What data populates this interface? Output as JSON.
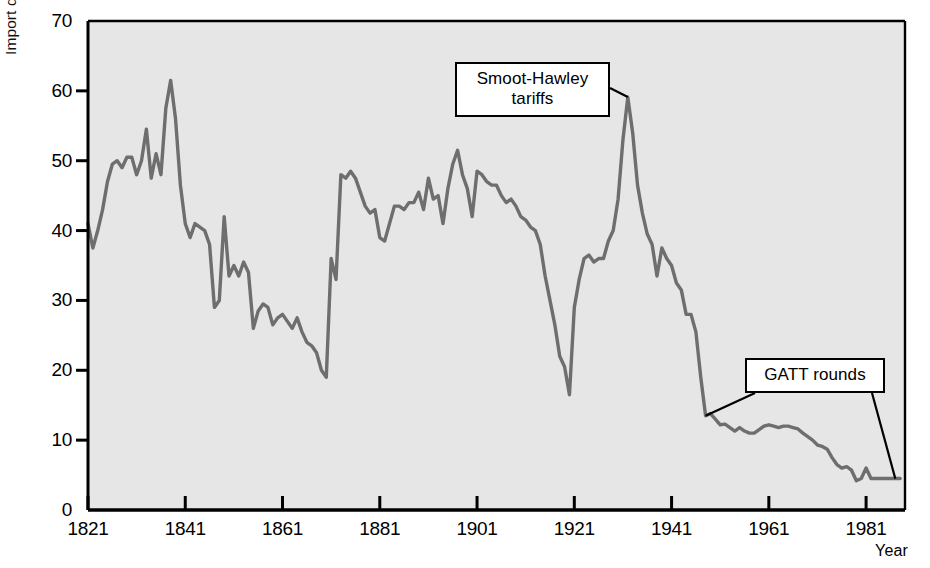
{
  "chart_data": {
    "type": "line",
    "title": "",
    "xlabel": "Year",
    "ylabel": "Import duties (percentage of imports)",
    "xlim": [
      1821,
      1989
    ],
    "ylim": [
      0,
      70
    ],
    "xticks": [
      1821,
      1841,
      1861,
      1881,
      1901,
      1921,
      1941,
      1961,
      1981
    ],
    "yticks": [
      0,
      10,
      20,
      30,
      40,
      50,
      60,
      70
    ],
    "grid": false,
    "legend": null,
    "series_name": "U.S. import duties as percentage of imports",
    "line_color": "#6e6e6e",
    "plot_background": "#e6e6e6",
    "axis_color": "#000000",
    "annotations": [
      {
        "label": "Smoot-Hawley tariffs",
        "lines": [
          "Smoot-Hawley",
          "tariffs"
        ],
        "points_to_year": 1932,
        "points_to_value": 59.1
      },
      {
        "label": "GATT rounds",
        "lines": [
          "GATT rounds"
        ],
        "points_to_year": 1948,
        "points_to_value": 13.5,
        "points_to_year_2": 1987,
        "points_to_value_2": 4.5
      }
    ],
    "x": [
      1821,
      1822,
      1823,
      1824,
      1825,
      1826,
      1827,
      1828,
      1829,
      1830,
      1831,
      1832,
      1833,
      1834,
      1835,
      1836,
      1837,
      1838,
      1839,
      1840,
      1841,
      1842,
      1843,
      1844,
      1845,
      1846,
      1847,
      1848,
      1849,
      1850,
      1851,
      1852,
      1853,
      1854,
      1855,
      1856,
      1857,
      1858,
      1859,
      1860,
      1861,
      1862,
      1863,
      1864,
      1865,
      1866,
      1867,
      1868,
      1869,
      1870,
      1871,
      1872,
      1873,
      1874,
      1875,
      1876,
      1877,
      1878,
      1879,
      1880,
      1881,
      1882,
      1883,
      1884,
      1885,
      1886,
      1887,
      1888,
      1889,
      1890,
      1891,
      1892,
      1893,
      1894,
      1895,
      1896,
      1897,
      1898,
      1899,
      1900,
      1901,
      1902,
      1903,
      1904,
      1905,
      1906,
      1907,
      1908,
      1909,
      1910,
      1911,
      1912,
      1913,
      1914,
      1915,
      1916,
      1917,
      1918,
      1919,
      1920,
      1921,
      1922,
      1923,
      1924,
      1925,
      1926,
      1927,
      1928,
      1929,
      1930,
      1931,
      1932,
      1933,
      1934,
      1935,
      1936,
      1937,
      1938,
      1939,
      1940,
      1941,
      1942,
      1943,
      1944,
      1945,
      1946,
      1947,
      1948,
      1949,
      1950,
      1951,
      1952,
      1953,
      1954,
      1955,
      1956,
      1957,
      1958,
      1959,
      1960,
      1961,
      1962,
      1963,
      1964,
      1965,
      1966,
      1967,
      1968,
      1969,
      1970,
      1971,
      1972,
      1973,
      1974,
      1975,
      1976,
      1977,
      1978,
      1979,
      1980,
      1981,
      1982,
      1983,
      1984,
      1985,
      1986,
      1987,
      1988
    ],
    "y": [
      41.0,
      37.5,
      40.0,
      43.0,
      47.0,
      49.5,
      50.0,
      49.0,
      50.5,
      50.5,
      48.0,
      50.0,
      54.5,
      47.5,
      51.0,
      48.0,
      57.5,
      61.5,
      56.0,
      46.5,
      41.0,
      39.0,
      41.0,
      40.5,
      40.0,
      38.0,
      29.0,
      30.0,
      42.0,
      33.5,
      35.0,
      33.5,
      35.5,
      34.0,
      26.0,
      28.5,
      29.5,
      29.0,
      26.5,
      27.5,
      28.0,
      27.0,
      26.0,
      27.5,
      25.5,
      24.0,
      23.5,
      22.5,
      20.0,
      19.0,
      36.0,
      33.0,
      48.0,
      47.5,
      48.5,
      47.5,
      45.5,
      43.5,
      42.5,
      43.0,
      39.0,
      38.5,
      41.0,
      43.5,
      43.5,
      43.0,
      44.0,
      44.0,
      45.5,
      43.0,
      47.5,
      44.5,
      45.0,
      41.0,
      46.0,
      49.5,
      51.5,
      48.0,
      46.0,
      42.0,
      48.5,
      48.0,
      47.0,
      46.5,
      46.5,
      45.0,
      44.0,
      44.5,
      43.5,
      42.0,
      41.5,
      40.5,
      40.0,
      38.0,
      33.5,
      30.0,
      26.5,
      22.0,
      20.5,
      16.5,
      29.0,
      33.0,
      36.0,
      36.5,
      35.5,
      36.0,
      36.0,
      38.5,
      40.0,
      44.5,
      53.0,
      59.1,
      54.0,
      46.5,
      42.5,
      39.5,
      38.0,
      33.5,
      37.5,
      36.0,
      35.0,
      32.5,
      31.5,
      28.0,
      28.0,
      25.5,
      19.0,
      13.5,
      13.8,
      13.0,
      12.2,
      12.3,
      11.8,
      11.3,
      11.8,
      11.3,
      11.0,
      11.0,
      11.5,
      12.0,
      12.2,
      12.0,
      11.8,
      12.0,
      12.0,
      11.8,
      11.6,
      11.0,
      10.5,
      10.0,
      9.3,
      9.1,
      8.7,
      7.5,
      6.5,
      6.0,
      6.2,
      5.7,
      4.2,
      4.5,
      6.0,
      4.5,
      4.5,
      4.5,
      4.5,
      4.5,
      4.5,
      4.5
    ]
  },
  "axis": {
    "x_title": "Year",
    "y_title": "Import duties (percentage of imports)"
  }
}
